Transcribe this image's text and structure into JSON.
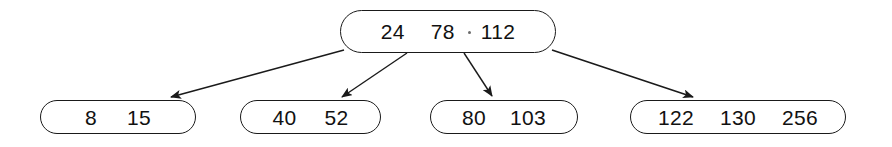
{
  "diagram": {
    "type": "b-tree",
    "stroke_color": "#1a1a1a",
    "fill_color": "#ffffff",
    "background_color": "#ffffff",
    "nodes": [
      {
        "id": "root",
        "role": "root",
        "keys": [
          "24",
          "78",
          "112"
        ]
      },
      {
        "id": "leaf-0",
        "role": "leaf",
        "keys": [
          "8",
          "15"
        ]
      },
      {
        "id": "leaf-1",
        "role": "leaf",
        "keys": [
          "40",
          "52"
        ]
      },
      {
        "id": "leaf-2",
        "role": "leaf",
        "keys": [
          "80",
          "103"
        ]
      },
      {
        "id": "leaf-3",
        "role": "leaf",
        "keys": [
          "122",
          "130",
          "256"
        ]
      }
    ],
    "edges": [
      {
        "id": "edge-0",
        "from": "root",
        "to": "leaf-0"
      },
      {
        "id": "edge-1",
        "from": "root",
        "to": "leaf-1"
      },
      {
        "id": "edge-2",
        "from": "root",
        "to": "leaf-2"
      },
      {
        "id": "edge-3",
        "from": "root",
        "to": "leaf-3"
      }
    ]
  }
}
